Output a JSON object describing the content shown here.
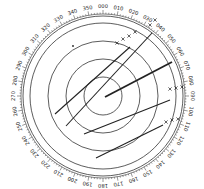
{
  "diagram": {
    "type": "radar-plotting-sheet",
    "center": [
      103,
      96
    ],
    "bearing_ring": {
      "radius_inner": 80,
      "radius_outer": 82,
      "label_radius": 89,
      "label_step_deg": 10,
      "labels": [
        "000",
        "010",
        "020",
        "030",
        "040",
        "050",
        "060",
        "070",
        "080",
        "090",
        "100",
        "110",
        "120",
        "130",
        "140",
        "150",
        "160",
        "170",
        "180",
        "190",
        "200",
        "210",
        "220",
        "230",
        "240",
        "250",
        "260",
        "270",
        "280",
        "290",
        "300",
        "310",
        "320",
        "330",
        "340",
        "350"
      ]
    },
    "range_rings": [
      19,
      37,
      55,
      73
    ],
    "own_ship_vector": {
      "from": [
        105,
        97
      ],
      "to": [
        172,
        62
      ]
    },
    "track_lines": [
      {
        "from": [
          55,
          114
        ],
        "to": [
          130,
          47
        ]
      },
      {
        "from": [
          66,
          126
        ],
        "to": [
          152,
          33
        ]
      },
      {
        "from": [
          84,
          134
        ],
        "to": [
          170,
          100
        ]
      },
      {
        "from": [
          96,
          158
        ],
        "to": [
          163,
          125
        ]
      }
    ],
    "plot_markers": [
      {
        "symbol": "x",
        "pos": [
          117,
          43
        ]
      },
      {
        "symbol": "x",
        "pos": [
          123,
          39
        ]
      },
      {
        "symbol": "x",
        "pos": [
          129,
          36
        ]
      },
      {
        "symbol": "x",
        "pos": [
          135,
          32
        ]
      },
      {
        "symbol": "x",
        "pos": [
          150,
          25
        ]
      },
      {
        "symbol": "x",
        "pos": [
          155,
          20
        ]
      },
      {
        "symbol": "x",
        "pos": [
          170,
          89
        ]
      },
      {
        "symbol": "x",
        "pos": [
          176,
          88
        ]
      },
      {
        "symbol": "x",
        "pos": [
          182,
          87
        ]
      },
      {
        "symbol": "x",
        "pos": [
          166,
          122
        ]
      },
      {
        "symbol": "x",
        "pos": [
          172,
          120
        ]
      },
      {
        "symbol": "x",
        "pos": [
          178,
          119
        ]
      }
    ],
    "dots": [
      [
        73,
        46
      ]
    ],
    "colors": {
      "line": "#222222",
      "ring": "#333333",
      "background": "#ffffff"
    }
  }
}
